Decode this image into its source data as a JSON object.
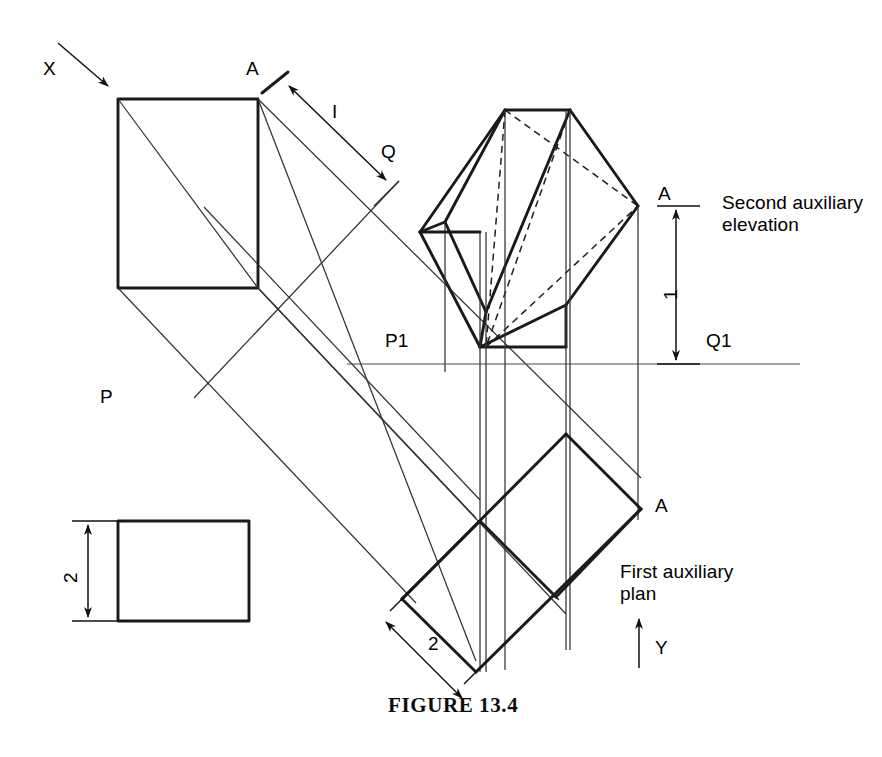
{
  "figure": {
    "caption": "FIGURE 13.4",
    "domain_note": "orthographic-projection-auxiliary-views"
  },
  "labels": {
    "x_direction": "X",
    "y_direction": "Y",
    "a_top": "A",
    "a_elevation": "A",
    "a_plan": "A",
    "q_top": "Q",
    "p_top": "P",
    "p1": "P1",
    "q1": "Q1",
    "dim_one_top": "I",
    "dim_one_right": "1",
    "dim_two_left": "2",
    "dim_two_plan": "2",
    "second_auxiliary_elevation_line1": "Second auxiliary",
    "second_auxiliary_elevation_line2": "elevation",
    "first_auxiliary_plan_line1": "First auxiliary",
    "first_auxiliary_plan_line2": "plan"
  },
  "icons": {
    "x_arrow": "arrow-down-right-icon",
    "y_arrow": "arrow-up-icon",
    "dim_arrow_double": "double-headed-arrow-icon"
  },
  "colors": {
    "ink": "#111111",
    "thin_line": "#333333",
    "hidden_line": "#1f1f1f",
    "paper": "#ffffff"
  },
  "geometry": {
    "front_view_rect": {
      "x": 118,
      "y": 99,
      "w": 140,
      "h": 189
    },
    "end_view_rect": {
      "x": 118,
      "y": 521,
      "w": 131,
      "h": 100
    },
    "pq_line_right": {
      "y": 364,
      "x1": 347,
      "x2": 800
    },
    "second_aux_datum_y": 206,
    "second_aux_base_y": 364,
    "aux_elevation_top_y": 110
  }
}
